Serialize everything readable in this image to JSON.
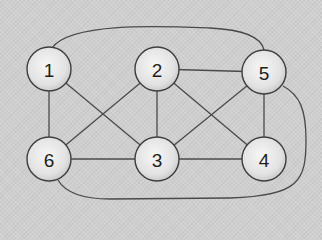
{
  "graph": {
    "nodes": [
      {
        "id": "1",
        "label": "1",
        "x": 49,
        "y": 69,
        "r": 22
      },
      {
        "id": "2",
        "label": "2",
        "x": 157,
        "y": 69,
        "r": 22
      },
      {
        "id": "5",
        "label": "5",
        "x": 264,
        "y": 72,
        "r": 22
      },
      {
        "id": "6",
        "label": "6",
        "x": 49,
        "y": 159,
        "r": 22
      },
      {
        "id": "3",
        "label": "3",
        "x": 157,
        "y": 159,
        "r": 22
      },
      {
        "id": "4",
        "label": "4",
        "x": 264,
        "y": 159,
        "r": 22
      }
    ],
    "edges": [
      {
        "from": "1",
        "to": "6",
        "type": "straight"
      },
      {
        "from": "1",
        "to": "3",
        "type": "straight"
      },
      {
        "from": "6",
        "to": "2",
        "type": "straight"
      },
      {
        "from": "6",
        "to": "3",
        "type": "straight"
      },
      {
        "from": "2",
        "to": "3",
        "type": "straight"
      },
      {
        "from": "2",
        "to": "5",
        "type": "straight"
      },
      {
        "from": "2",
        "to": "4",
        "type": "straight"
      },
      {
        "from": "3",
        "to": "5",
        "type": "straight"
      },
      {
        "from": "3",
        "to": "4",
        "type": "straight"
      },
      {
        "from": "5",
        "to": "4",
        "type": "straight"
      },
      {
        "from": "1",
        "to": "5",
        "type": "curve-top",
        "path": "M 52 48 C 70 22, 160 26, 210 28 C 250 30, 262 40, 264 50"
      },
      {
        "from": "5",
        "to": "6",
        "type": "curve-bottom-right",
        "path": "M 283 86 C 300 95, 306 110, 306 140 C 306 180, 300 196, 230 198 L 110 199 C 80 199, 65 192, 58 180"
      }
    ],
    "colors": {
      "background": "#cfcfcf",
      "edge": "#4a4a4a",
      "node_fill_light": "#f4f4f4",
      "node_fill_dark": "#c8c8c8",
      "node_stroke": "#3e3e3e",
      "label": "#1e1e1e"
    }
  }
}
